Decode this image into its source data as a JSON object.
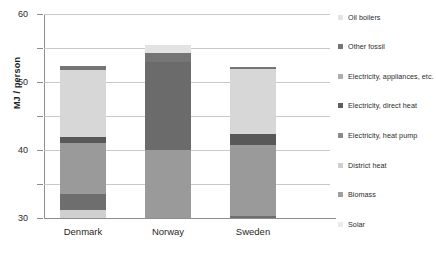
{
  "chart_data": {
    "type": "bar",
    "subtype": "stacked-bar",
    "title": "",
    "xlabel": "",
    "ylabel": "MJ / person",
    "ylim": [
      0,
      60
    ],
    "ytick_values": [
      0,
      10,
      20,
      30,
      40,
      50,
      60
    ],
    "ytick_labels": [
      "0",
      "10",
      "20",
      "30",
      "40",
      "50",
      "60"
    ],
    "grid": true,
    "legend_position": "right",
    "categories": [
      "Denmark",
      "Norway",
      "Sweden"
    ],
    "series": [
      {
        "name": "Solar",
        "color": "#d0d0d0",
        "values": [
          2.5,
          0.0,
          0.0
        ]
      },
      {
        "name": "Biomass",
        "color": "#6e6e6e",
        "values": [
          4.7,
          0.0,
          0.7
        ]
      },
      {
        "name": "District heat",
        "color": "#9a9a9a",
        "values": [
          14.8,
          20.0,
          20.8
        ]
      },
      {
        "name": "Electricity, heat pump",
        "color": "#585858",
        "values": [
          1.9,
          0.0,
          3.2
        ]
      },
      {
        "name": "Electricity, direct heat",
        "color": "#6b6b6b",
        "values": [
          0.0,
          26.0,
          0.0
        ]
      },
      {
        "name": "Electricity, appliances, etc.",
        "color": "#d7d7d7",
        "values": [
          19.5,
          0.0,
          19.1
        ]
      },
      {
        "name": "Other fossil",
        "color": "#757575",
        "values": [
          1.3,
          2.6,
          0.6
        ]
      },
      {
        "name": "Oil boilers",
        "color": "#e3e3e3",
        "values": [
          0.0,
          2.2,
          0.0
        ]
      }
    ],
    "totals": [
      44.7,
      50.8,
      44.4
    ],
    "stack_order_bottom_to_top": [
      "Solar",
      "Biomass",
      "District heat",
      "Electricity, heat pump",
      "Electricity, direct heat",
      "Electricity, appliances, etc.",
      "Other fossil",
      "Oil boilers"
    ]
  },
  "legend": {
    "items": [
      {
        "label": "Oil boilers",
        "color": "#e3e3e3"
      },
      {
        "label": "Other fossil",
        "color": "#757575"
      },
      {
        "label": "Electricity, appliances, etc.",
        "color": "#aeaeae"
      },
      {
        "label": "Electricity, direct heat",
        "color": "#5e5e5e"
      },
      {
        "label": "Electricity, heat pump",
        "color": "#8a8a8a"
      },
      {
        "label": "District heat",
        "color": "#cfcfcf"
      },
      {
        "label": "Biomass",
        "color": "#9f9f9f"
      },
      {
        "label": "Solar",
        "color": "#ebebeb"
      }
    ]
  },
  "axes": {
    "y_title": "MJ / person"
  }
}
